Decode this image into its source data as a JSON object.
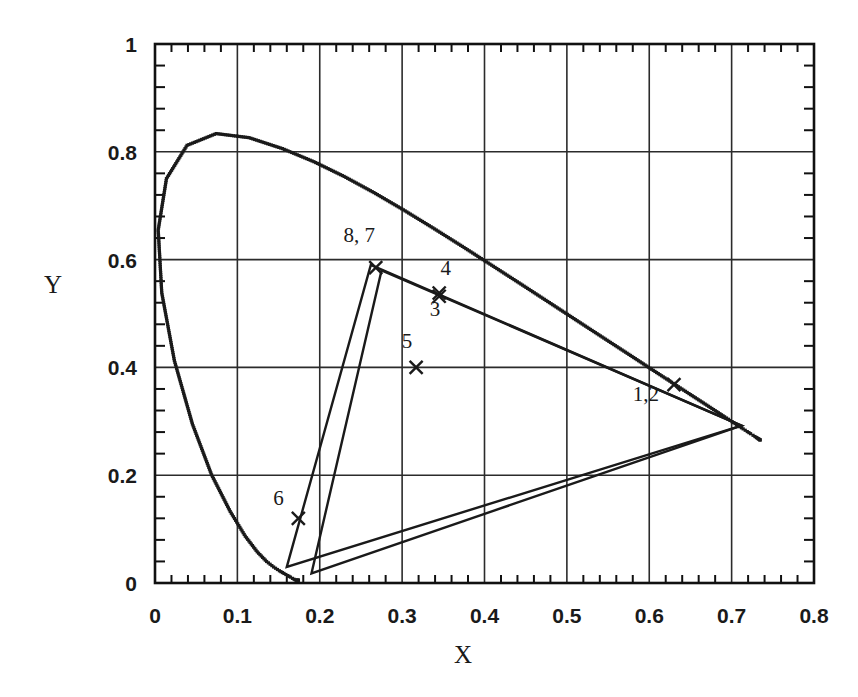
{
  "chart_data": {
    "type": "scatter",
    "title": "",
    "subtitle": "",
    "xlabel": "X",
    "ylabel": "Y",
    "xlim": [
      0,
      0.8
    ],
    "ylim": [
      0,
      1
    ],
    "grid": true,
    "legend": "none",
    "x_ticks": [
      "0",
      "0.1",
      "0.2",
      "0.3",
      "0.4",
      "0.5",
      "0.6",
      "0.7",
      "0.8"
    ],
    "x_tick_values": [
      0,
      0.1,
      0.2,
      0.3,
      0.4,
      0.5,
      0.6,
      0.7,
      0.8
    ],
    "y_ticks": [
      "0",
      "0.2",
      "0.4",
      "0.6",
      "0.8",
      "1"
    ],
    "y_tick_values": [
      0,
      0.2,
      0.4,
      0.6,
      0.8,
      1
    ],
    "minor_ticks_per_major_x": 5,
    "minor_ticks_per_major_y": 5,
    "series": [
      {
        "name": "spectral-locus",
        "style": "dotted",
        "points": [
          [
            0.1741,
            0.005
          ],
          [
            0.174,
            0.005
          ],
          [
            0.1738,
            0.0049
          ],
          [
            0.1736,
            0.0049
          ],
          [
            0.1733,
            0.0048
          ],
          [
            0.173,
            0.0048
          ],
          [
            0.1726,
            0.0048
          ],
          [
            0.1721,
            0.0048
          ],
          [
            0.1714,
            0.0051
          ],
          [
            0.1703,
            0.0058
          ],
          [
            0.1689,
            0.0069
          ],
          [
            0.1669,
            0.0086
          ],
          [
            0.1644,
            0.0109
          ],
          [
            0.1611,
            0.0138
          ],
          [
            0.1566,
            0.0177
          ],
          [
            0.151,
            0.0227
          ],
          [
            0.144,
            0.0297
          ],
          [
            0.1355,
            0.0399
          ],
          [
            0.1241,
            0.0578
          ],
          [
            0.1096,
            0.0868
          ],
          [
            0.0913,
            0.1327
          ],
          [
            0.0687,
            0.2007
          ],
          [
            0.0454,
            0.295
          ],
          [
            0.0235,
            0.4127
          ],
          [
            0.0082,
            0.5384
          ],
          [
            0.0039,
            0.6548
          ],
          [
            0.0139,
            0.7502
          ],
          [
            0.0389,
            0.812
          ],
          [
            0.0743,
            0.8338
          ],
          [
            0.1142,
            0.8262
          ],
          [
            0.1547,
            0.8059
          ],
          [
            0.1929,
            0.7816
          ],
          [
            0.2296,
            0.7543
          ],
          [
            0.2658,
            0.7243
          ],
          [
            0.3016,
            0.6923
          ],
          [
            0.3373,
            0.6589
          ],
          [
            0.3731,
            0.6245
          ],
          [
            0.4087,
            0.5896
          ],
          [
            0.4441,
            0.5547
          ],
          [
            0.4788,
            0.5202
          ],
          [
            0.5125,
            0.4866
          ],
          [
            0.5448,
            0.4544
          ],
          [
            0.5752,
            0.4242
          ],
          [
            0.6029,
            0.3965
          ],
          [
            0.627,
            0.3725
          ],
          [
            0.6482,
            0.3514
          ],
          [
            0.6658,
            0.334
          ],
          [
            0.6801,
            0.3197
          ],
          [
            0.6915,
            0.3083
          ],
          [
            0.7006,
            0.2993
          ],
          [
            0.7079,
            0.292
          ],
          [
            0.714,
            0.2859
          ],
          [
            0.719,
            0.2809
          ],
          [
            0.723,
            0.277
          ],
          [
            0.726,
            0.274
          ],
          [
            0.7283,
            0.2717
          ],
          [
            0.73,
            0.27
          ],
          [
            0.7311,
            0.2689
          ],
          [
            0.732,
            0.268
          ],
          [
            0.7327,
            0.2673
          ],
          [
            0.7334,
            0.2666
          ],
          [
            0.734,
            0.266
          ],
          [
            0.7344,
            0.2656
          ],
          [
            0.7346,
            0.2654
          ],
          [
            0.7347,
            0.2653
          ]
        ]
      },
      {
        "name": "gamut-triangle-outer",
        "style": "solid",
        "closed": true,
        "points": [
          [
            0.16,
            0.03
          ],
          [
            0.262,
            0.59
          ],
          [
            0.712,
            0.292
          ]
        ]
      },
      {
        "name": "gamut-triangle-inner",
        "style": "solid",
        "closed": true,
        "points": [
          [
            0.19,
            0.018
          ],
          [
            0.275,
            0.58
          ],
          [
            0.712,
            0.292
          ]
        ]
      }
    ],
    "annotations": [
      {
        "label": "8, 7",
        "x": 0.268,
        "y": 0.585,
        "label_x": 0.248,
        "label_y": 0.632,
        "marker": "x"
      },
      {
        "label": "4",
        "x": 0.345,
        "y": 0.538,
        "label_x": 0.353,
        "label_y": 0.572,
        "marker": "x"
      },
      {
        "label": "3",
        "x": 0.345,
        "y": 0.532,
        "label_x": 0.34,
        "label_y": 0.496,
        "marker": "x"
      },
      {
        "label": "5",
        "x": 0.317,
        "y": 0.4,
        "label_x": 0.306,
        "label_y": 0.436,
        "marker": "x"
      },
      {
        "label": "1,2",
        "x": 0.63,
        "y": 0.368,
        "label_x": 0.596,
        "label_y": 0.338,
        "marker": "x"
      },
      {
        "label": "6",
        "x": 0.174,
        "y": 0.12,
        "label_x": 0.15,
        "label_y": 0.145,
        "marker": "x"
      }
    ],
    "marked_points": [
      {
        "id": "1",
        "x": 0.63,
        "y": 0.368
      },
      {
        "id": "2",
        "x": 0.63,
        "y": 0.368
      },
      {
        "id": "3",
        "x": 0.345,
        "y": 0.532
      },
      {
        "id": "4",
        "x": 0.345,
        "y": 0.538
      },
      {
        "id": "5",
        "x": 0.317,
        "y": 0.4
      },
      {
        "id": "6",
        "x": 0.174,
        "y": 0.12
      },
      {
        "id": "7",
        "x": 0.27,
        "y": 0.583
      },
      {
        "id": "8",
        "x": 0.266,
        "y": 0.587
      }
    ],
    "colors": {
      "ink": "#1a1a1a",
      "grid": "#2b2b2b",
      "axis": "#111111",
      "background": "#ffffff"
    }
  },
  "figure": {
    "x_axis_title": "X",
    "y_axis_title": "Y"
  }
}
